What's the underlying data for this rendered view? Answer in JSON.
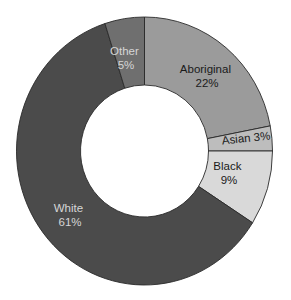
{
  "chart_data": {
    "type": "pie",
    "variant": "donut",
    "title": "",
    "start_angle_deg": 0,
    "direction": "clockwise",
    "categories": [
      "Aboriginal",
      "Asian",
      "Black",
      "White",
      "Other"
    ],
    "values": [
      22,
      3,
      9,
      61,
      5
    ],
    "unit": "%",
    "slices": [
      {
        "label": "Aboriginal",
        "value": 22,
        "display": "22%",
        "color": "#9b9b9b",
        "text_color": "#1a1a1a"
      },
      {
        "label": "Asian",
        "value": 3,
        "display": "3%",
        "color": "#bdbdbd",
        "text_color": "#1a1a1a"
      },
      {
        "label": "Black",
        "value": 9,
        "display": "9%",
        "color": "#d9d9d9",
        "text_color": "#1a1a1a"
      },
      {
        "label": "White",
        "value": 61,
        "display": "61%",
        "color": "#4b4b4b",
        "text_color": "#d6d6d6"
      },
      {
        "label": "Other",
        "value": 5,
        "display": "5%",
        "color": "#6f6f6f",
        "text_color": "#d6d6d6"
      }
    ],
    "legend": "none",
    "labels_inside_slices": true
  },
  "labels": {
    "aboriginal": {
      "name": "Aboriginal",
      "pct": "22%"
    },
    "asian": {
      "text": "Asian 3%"
    },
    "black": {
      "name": "Black",
      "pct": "9%"
    },
    "white": {
      "name": "White",
      "pct": "61%"
    },
    "other": {
      "name": "Other",
      "pct": "5%"
    }
  }
}
